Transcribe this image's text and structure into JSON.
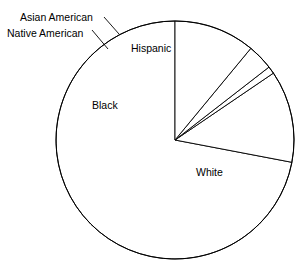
{
  "chart_data": {
    "type": "pie",
    "title": "",
    "subtitle": "",
    "xlabel": "",
    "ylabel": "",
    "grid": false,
    "legend": "none",
    "label_placement": "inside-and-callout",
    "start_angle_deg": 0,
    "direction": "counterclockwise",
    "categories": [
      "White",
      "Black",
      "Native American",
      "Asian American",
      "Hispanic"
    ],
    "values": [
      72.0,
      12.5,
      1.0,
      3.5,
      11.0
    ],
    "units": "percent",
    "slices": [
      {
        "label": "White",
        "value": 72.0,
        "start_deg": 0.0,
        "end_deg": 259.2,
        "label_position": "inside",
        "has_leader_line": false
      },
      {
        "label": "Black",
        "value": 12.5,
        "start_deg": 259.2,
        "end_deg": 304.2,
        "label_position": "inside",
        "has_leader_line": false
      },
      {
        "label": "Native American",
        "value": 1.0,
        "start_deg": 304.2,
        "end_deg": 307.8,
        "label_position": "outside",
        "has_leader_line": true
      },
      {
        "label": "Asian American",
        "value": 3.5,
        "start_deg": 307.8,
        "end_deg": 320.4,
        "label_position": "outside",
        "has_leader_line": true
      },
      {
        "label": "Hispanic",
        "value": 11.0,
        "start_deg": 320.4,
        "end_deg": 360.0,
        "label_position": "inside",
        "has_leader_line": false
      }
    ]
  },
  "labels": {
    "white": "White",
    "black": "Black",
    "hispanic": "Hispanic",
    "asian_american": "Asian American",
    "native_american": "Native American"
  },
  "style": {
    "slice_fill": "#ffffff",
    "stroke_color": "#000000",
    "background": "#ffffff",
    "text_color": "#000000"
  },
  "geometry": {
    "center_x": 175,
    "center_y": 140,
    "radius": 119
  }
}
